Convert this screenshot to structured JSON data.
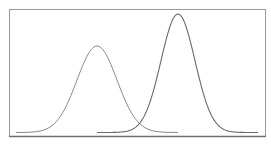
{
  "chart_data": {
    "type": "line",
    "title": "",
    "xlabel": "",
    "ylabel": "",
    "grid": false,
    "legend": null,
    "series": [
      {
        "name": "left-distribution",
        "mean_px": 97,
        "peak_height_rel": 0.73,
        "sd_px": 20,
        "x_range_px": [
          16,
          178
        ],
        "color": "#8a8a8a"
      },
      {
        "name": "right-distribution",
        "mean_px": 178,
        "peak_height_rel": 1.0,
        "sd_px": 17,
        "x_range_px": [
          97,
          258
        ],
        "color": "#707070"
      }
    ],
    "frame": {
      "left": 9,
      "top": 9,
      "right": 265,
      "bottom": 136
    }
  },
  "colors": {
    "frame": "#9a9a9a",
    "frame_bottom": "#6e6e6e",
    "curve_left": "#8a8a8a",
    "curve_right": "#6a6a6a"
  }
}
